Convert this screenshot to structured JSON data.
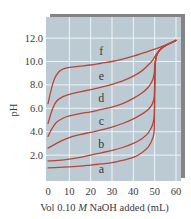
{
  "colors": {
    "plot_background": "#bccbd3",
    "gridline": "#eef3f6",
    "curve": "#b8453a",
    "shadow": "#6e6e6e",
    "text": "#3a3a3a"
  },
  "chart_data": {
    "type": "line",
    "title": "",
    "xlabel": "Vol 0.10 M NaOH added (mL)",
    "xlabel_parts": {
      "prefix": "Vol 0.10 ",
      "italic": "M",
      "suffix": " NaOH added (mL)"
    },
    "ylabel": "pH",
    "xlim": [
      0,
      60
    ],
    "ylim": [
      0,
      13.6
    ],
    "xticks": [
      0,
      10,
      20,
      30,
      40,
      50,
      60
    ],
    "xtick_labels": [
      "0",
      "10",
      "20",
      "30",
      "40",
      "50",
      "60"
    ],
    "yticks": [
      2,
      4,
      6,
      8,
      10,
      12
    ],
    "ytick_labels": [
      "2.0",
      "4.0",
      "6.0",
      "8.0",
      "10.0",
      "12.0"
    ],
    "grid": true,
    "legend": "inline curve labels",
    "series": [
      {
        "name": "a",
        "label_at": [
          25,
          0.45
        ],
        "points": [
          [
            0,
            0.9
          ],
          [
            5,
            0.95
          ],
          [
            10,
            1.0
          ],
          [
            15,
            1.05
          ],
          [
            20,
            1.15
          ],
          [
            25,
            1.25
          ],
          [
            30,
            1.35
          ],
          [
            35,
            1.55
          ],
          [
            40,
            1.8
          ],
          [
            44,
            2.2
          ],
          [
            47,
            2.7
          ],
          [
            49,
            3.4
          ],
          [
            49.8,
            4.2
          ],
          [
            50,
            7.0
          ],
          [
            50.2,
            9.6
          ],
          [
            51,
            10.6
          ],
          [
            53,
            11.1
          ],
          [
            55,
            11.35
          ],
          [
            60,
            11.8
          ]
        ]
      },
      {
        "name": "b",
        "label_at": [
          25,
          2.6
        ],
        "points": [
          [
            0,
            1.5
          ],
          [
            5,
            1.55
          ],
          [
            10,
            1.65
          ],
          [
            15,
            1.8
          ],
          [
            20,
            2.0
          ],
          [
            25,
            2.2
          ],
          [
            30,
            2.4
          ],
          [
            35,
            2.65
          ],
          [
            40,
            3.0
          ],
          [
            44,
            3.4
          ],
          [
            47,
            3.9
          ],
          [
            49,
            4.6
          ],
          [
            49.8,
            5.4
          ],
          [
            50,
            7.5
          ],
          [
            50.3,
            9.8
          ],
          [
            51,
            10.6
          ],
          [
            53,
            11.1
          ],
          [
            55,
            11.35
          ],
          [
            60,
            11.8
          ]
        ]
      },
      {
        "name": "c",
        "label_at": [
          25,
          4.6
        ],
        "points": [
          [
            0,
            2.6
          ],
          [
            3,
            2.9
          ],
          [
            6,
            3.2
          ],
          [
            10,
            3.5
          ],
          [
            15,
            3.75
          ],
          [
            20,
            3.95
          ],
          [
            25,
            4.15
          ],
          [
            30,
            4.4
          ],
          [
            35,
            4.7
          ],
          [
            40,
            5.1
          ],
          [
            44,
            5.5
          ],
          [
            47,
            5.9
          ],
          [
            49,
            6.4
          ],
          [
            49.8,
            7.0
          ],
          [
            50,
            8.3
          ],
          [
            50.3,
            9.9
          ],
          [
            51,
            10.6
          ],
          [
            53,
            11.1
          ],
          [
            55,
            11.35
          ],
          [
            60,
            11.8
          ]
        ]
      },
      {
        "name": "d",
        "label_at": [
          25,
          6.55
        ],
        "points": [
          [
            0,
            3.6
          ],
          [
            2,
            4.3
          ],
          [
            4,
            4.8
          ],
          [
            7,
            5.15
          ],
          [
            10,
            5.35
          ],
          [
            15,
            5.55
          ],
          [
            20,
            5.7
          ],
          [
            25,
            5.9
          ],
          [
            30,
            6.1
          ],
          [
            35,
            6.4
          ],
          [
            40,
            6.85
          ],
          [
            44,
            7.3
          ],
          [
            47,
            7.8
          ],
          [
            49,
            8.4
          ],
          [
            49.8,
            9.0
          ],
          [
            50,
            9.6
          ],
          [
            50.5,
            10.2
          ],
          [
            51.5,
            10.75
          ],
          [
            53,
            11.1
          ],
          [
            55,
            11.35
          ],
          [
            60,
            11.8
          ]
        ]
      },
      {
        "name": "e",
        "label_at": [
          25,
          8.45
        ],
        "points": [
          [
            0,
            4.7
          ],
          [
            2,
            5.9
          ],
          [
            4,
            6.6
          ],
          [
            7,
            7.0
          ],
          [
            10,
            7.2
          ],
          [
            15,
            7.4
          ],
          [
            20,
            7.6
          ],
          [
            25,
            7.8
          ],
          [
            30,
            8.05
          ],
          [
            35,
            8.35
          ],
          [
            40,
            8.75
          ],
          [
            44,
            9.2
          ],
          [
            47,
            9.7
          ],
          [
            49,
            10.1
          ],
          [
            50,
            10.4
          ],
          [
            51,
            10.7
          ],
          [
            53,
            11.1
          ],
          [
            55,
            11.35
          ],
          [
            60,
            11.8
          ]
        ]
      },
      {
        "name": "f",
        "label_at": [
          25,
          10.55
        ],
        "points": [
          [
            0,
            6.4
          ],
          [
            1.5,
            7.6
          ],
          [
            3,
            8.5
          ],
          [
            5,
            9.1
          ],
          [
            7,
            9.35
          ],
          [
            10,
            9.5
          ],
          [
            15,
            9.6
          ],
          [
            20,
            9.7
          ],
          [
            25,
            9.85
          ],
          [
            30,
            10.0
          ],
          [
            35,
            10.2
          ],
          [
            40,
            10.45
          ],
          [
            45,
            10.75
          ],
          [
            50,
            11.05
          ],
          [
            55,
            11.4
          ],
          [
            60,
            11.8
          ]
        ]
      }
    ]
  }
}
